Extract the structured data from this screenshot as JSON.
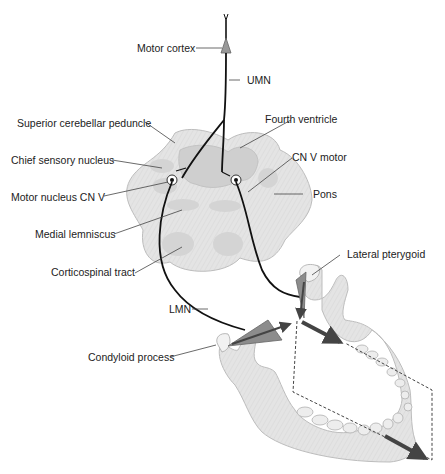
{
  "diagram": {
    "labels": {
      "motor_cortex": "Motor cortex",
      "umn": "UMN",
      "superior_cerebellar_peduncle": "Superior cerebellar peduncle",
      "fourth_ventricle": "Fourth ventricle",
      "chief_sensory_nucleus": "Chief sensory nucleus",
      "cn_v_motor": "CN V motor",
      "motor_nucleus_cn_v": "Motor nucleus CN V",
      "pons": "Pons",
      "medial_lemniscus": "Medial lemniscus",
      "corticospinal_tract": "Corticospinal tract",
      "lateral_pterygoid": "Lateral pterygoid",
      "lmn": "LMN",
      "condyloid_process": "Condyloid process"
    },
    "colors": {
      "tissue_fill": "#e2e2e2",
      "tissue_dark": "#c8c8c8",
      "ventricle": "#cfcfcf",
      "muscle": "#8a8a8a",
      "arrow": "#444444",
      "line": "#111111"
    }
  }
}
